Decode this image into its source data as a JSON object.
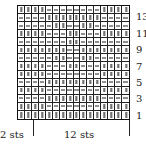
{
  "chart": {
    "type": "knitting-chart",
    "columns": 16,
    "rows": 14,
    "legend": {
      "|": "knit",
      "-": "purl"
    },
    "grid_top_to_bottom": [
      "||||--------||||",
      "----||||||||----",
      "-----||--||-----",
      "||||---||---||||",
      "-------||-------",
      "|||||||--|||||||",
      "-----||--||-----",
      "||||---||---||||",
      "||||--------||||",
      "----||||||||----",
      "||||--------||||",
      "----||||||||----",
      "||||--------||||",
      "||||||||||||||||"
    ],
    "row_labels": [
      {
        "row": 13,
        "text": "13"
      },
      {
        "row": 11,
        "text": "11"
      },
      {
        "row": 9,
        "text": "9"
      },
      {
        "row": 7,
        "text": "7"
      },
      {
        "row": 5,
        "text": "5"
      },
      {
        "row": 3,
        "text": "3"
      },
      {
        "row": 1,
        "text": "1"
      }
    ],
    "bottom_labels": {
      "edge": "2 sts",
      "repeat": "12 sts"
    }
  }
}
